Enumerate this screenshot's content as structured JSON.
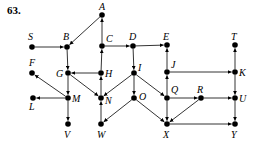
{
  "problem_number": "63.",
  "colors": {
    "ink": "#000000",
    "background": "#ffffff"
  },
  "nodes": [
    {
      "id": "A",
      "x": 102,
      "y": 15,
      "lx": 99,
      "ly": 10
    },
    {
      "id": "S",
      "x": 32,
      "y": 47,
      "lx": 28,
      "ly": 40
    },
    {
      "id": "B",
      "x": 67,
      "y": 47,
      "lx": 63,
      "ly": 40
    },
    {
      "id": "C",
      "x": 102,
      "y": 46,
      "lx": 106,
      "ly": 42
    },
    {
      "id": "D",
      "x": 133,
      "y": 46,
      "lx": 129,
      "ly": 40
    },
    {
      "id": "E",
      "x": 167,
      "y": 45,
      "lx": 163,
      "ly": 40
    },
    {
      "id": "T",
      "x": 235,
      "y": 45,
      "lx": 231,
      "ly": 40
    },
    {
      "id": "F",
      "x": 32,
      "y": 73,
      "lx": 29,
      "ly": 66
    },
    {
      "id": "G",
      "x": 68,
      "y": 73,
      "lx": 56,
      "ly": 77
    },
    {
      "id": "H",
      "x": 101,
      "y": 73,
      "lx": 105,
      "ly": 77
    },
    {
      "id": "I",
      "x": 134,
      "y": 73,
      "lx": 138,
      "ly": 71
    },
    {
      "id": "J",
      "x": 167,
      "y": 72,
      "lx": 171,
      "ly": 68
    },
    {
      "id": "K",
      "x": 235,
      "y": 72,
      "lx": 239,
      "ly": 76
    },
    {
      "id": "L",
      "x": 33,
      "y": 98,
      "lx": 29,
      "ly": 110
    },
    {
      "id": "M",
      "x": 68,
      "y": 98,
      "lx": 72,
      "ly": 102
    },
    {
      "id": "N",
      "x": 101,
      "y": 98,
      "lx": 105,
      "ly": 104
    },
    {
      "id": "O",
      "x": 134,
      "y": 98,
      "lx": 139,
      "ly": 100
    },
    {
      "id": "Q",
      "x": 167,
      "y": 98,
      "lx": 171,
      "ly": 93
    },
    {
      "id": "R",
      "x": 201,
      "y": 98,
      "lx": 197,
      "ly": 93
    },
    {
      "id": "U",
      "x": 235,
      "y": 98,
      "lx": 239,
      "ly": 102
    },
    {
      "id": "V",
      "x": 68,
      "y": 124,
      "lx": 64,
      "ly": 138
    },
    {
      "id": "W",
      "x": 101,
      "y": 124,
      "lx": 97,
      "ly": 138
    },
    {
      "id": "X",
      "x": 167,
      "y": 124,
      "lx": 163,
      "ly": 138
    },
    {
      "id": "Y",
      "x": 235,
      "y": 124,
      "lx": 231,
      "ly": 138
    }
  ],
  "edges": [
    [
      "S",
      "B"
    ],
    [
      "A",
      "B"
    ],
    [
      "B",
      "G"
    ],
    [
      "C",
      "A"
    ],
    [
      "H",
      "C"
    ],
    [
      "C",
      "D"
    ],
    [
      "D",
      "E"
    ],
    [
      "D",
      "I"
    ],
    [
      "J",
      "E"
    ],
    [
      "J",
      "K"
    ],
    [
      "K",
      "T"
    ],
    [
      "H",
      "G"
    ],
    [
      "G",
      "M"
    ],
    [
      "G",
      "N"
    ],
    [
      "M",
      "F"
    ],
    [
      "M",
      "L"
    ],
    [
      "M",
      "V"
    ],
    [
      "N",
      "H"
    ],
    [
      "W",
      "N"
    ],
    [
      "I",
      "N"
    ],
    [
      "I",
      "O"
    ],
    [
      "I",
      "Q"
    ],
    [
      "O",
      "W"
    ],
    [
      "O",
      "X"
    ],
    [
      "Q",
      "J"
    ],
    [
      "Q",
      "R"
    ],
    [
      "Q",
      "X"
    ],
    [
      "R",
      "U"
    ],
    [
      "R",
      "X"
    ],
    [
      "K",
      "U"
    ],
    [
      "U",
      "Y"
    ],
    [
      "X",
      "Y"
    ]
  ]
}
